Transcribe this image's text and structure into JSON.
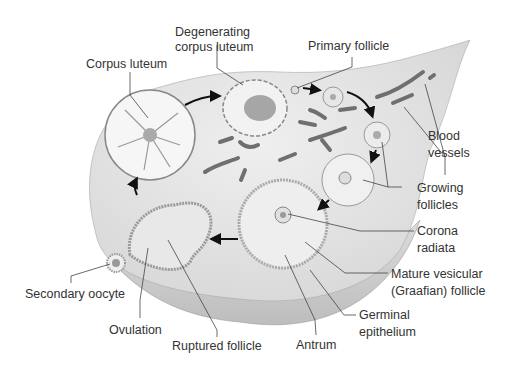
{
  "figure": {
    "labels": {
      "corpus_luteum": "Corpus luteum",
      "degenerating_1": "Degenerating",
      "degenerating_2": "corpus luteum",
      "primary_follicle": "Primary follicle",
      "blood_1": "Blood",
      "blood_2": "vessels",
      "growing_1": "Growing",
      "growing_2": "follicles",
      "corona_1": "Corona",
      "corona_2": "radiata",
      "mature_1": "Mature vesicular",
      "mature_2": "(Graafian) follicle",
      "germinal_1": "Germinal",
      "germinal_2": "epithelium",
      "antrum": "Antrum",
      "ruptured_follicle": "Ruptured follicle",
      "ovulation": "Ovulation",
      "secondary_oocyte": "Secondary oocyte"
    },
    "colors": {
      "ovary_fill": "#e4e4e4",
      "ovary_lower": "#d2d2d2",
      "structure_fill": "#f4f4f4",
      "vessel": "#6f6f6f",
      "text": "#333333"
    }
  }
}
